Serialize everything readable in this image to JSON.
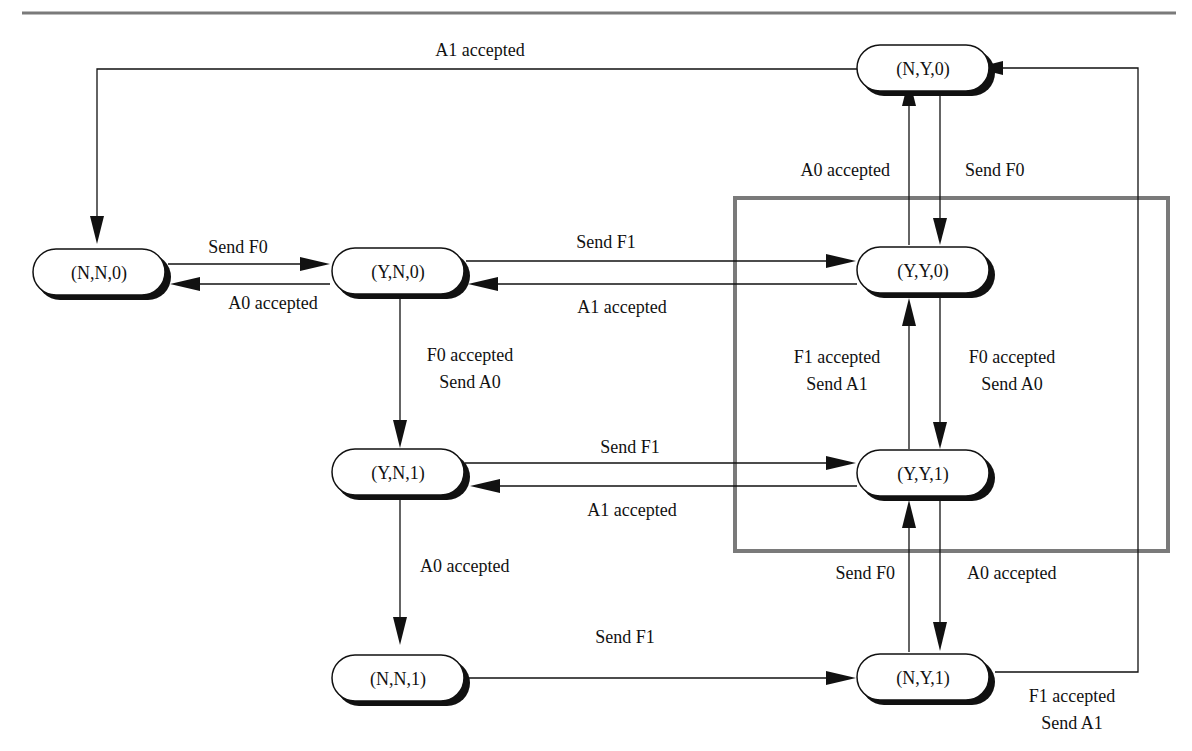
{
  "diagram": {
    "type": "state-transition",
    "states": [
      {
        "id": "NN0",
        "label": "(N,N,0)"
      },
      {
        "id": "YN0",
        "label": "(Y,N,0)"
      },
      {
        "id": "NY0",
        "label": "(N,Y,0)"
      },
      {
        "id": "YY0",
        "label": "(Y,Y,0)"
      },
      {
        "id": "YN1",
        "label": "(Y,N,1)"
      },
      {
        "id": "YY1",
        "label": "(Y,Y,1)"
      },
      {
        "id": "NN1",
        "label": "(N,N,1)"
      },
      {
        "id": "NY1",
        "label": "(N,Y,1)"
      }
    ],
    "transitions": [
      {
        "from": "NY0",
        "to": "NN0",
        "label": "A1 accepted"
      },
      {
        "from": "NN0",
        "to": "YN0",
        "label": "Send F0"
      },
      {
        "from": "YN0",
        "to": "NN0",
        "label": "A0 accepted"
      },
      {
        "from": "YN0",
        "to": "YY0",
        "label": "Send F1"
      },
      {
        "from": "YY0",
        "to": "YN0",
        "label": "A1 accepted"
      },
      {
        "from": "YY0",
        "to": "NY0",
        "label": "A0 accepted"
      },
      {
        "from": "NY0",
        "to": "YY0",
        "label": "Send F0"
      },
      {
        "from": "YN0",
        "to": "YN1",
        "label_line1": "F0 accepted",
        "label_line2": "Send A0"
      },
      {
        "from": "YY1",
        "to": "YY0",
        "label_line1": "F1 accepted",
        "label_line2": "Send A1"
      },
      {
        "from": "YY0",
        "to": "YY1",
        "label_line1": "F0 accepted",
        "label_line2": "Send A0"
      },
      {
        "from": "YN1",
        "to": "YY1",
        "label": "Send F1"
      },
      {
        "from": "YY1",
        "to": "YN1",
        "label": "A1 accepted"
      },
      {
        "from": "YN1",
        "to": "NN1",
        "label": "A0 accepted"
      },
      {
        "from": "NY1",
        "to": "YY1",
        "label": "Send F0"
      },
      {
        "from": "YY1",
        "to": "NY1",
        "label": "A0 accepted"
      },
      {
        "from": "NN1",
        "to": "NY1",
        "label": "Send F1"
      },
      {
        "from": "NY1",
        "to": "NY0",
        "label_line1": "F1 accepted",
        "label_line2": "Send A1"
      }
    ],
    "highlight_box": {
      "contains": [
        "YY0",
        "YY1"
      ],
      "color": "#7a7a7a"
    }
  }
}
